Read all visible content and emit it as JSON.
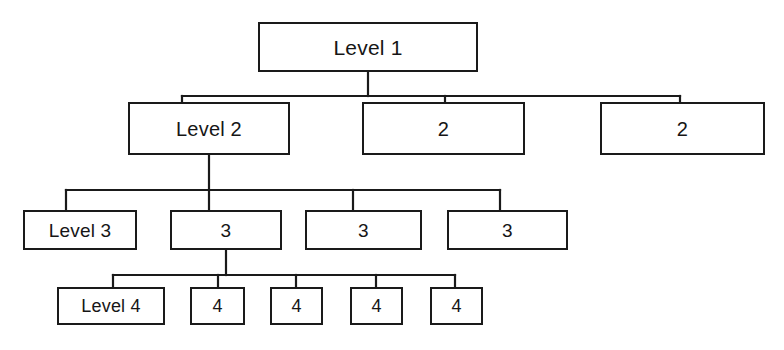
{
  "diagram": {
    "type": "tree-hierarchy",
    "background_color": "#ffffff",
    "line_color": "#1a1a1a",
    "text_color": "#161616",
    "levels": [
      {
        "level": 1,
        "nodes": [
          {
            "id": "n1",
            "label": "Level 1",
            "x": 258,
            "y": 22,
            "w": 220,
            "h": 50
          }
        ]
      },
      {
        "level": 2,
        "nodes": [
          {
            "id": "n2a",
            "label": "Level 2",
            "x": 128,
            "y": 102,
            "w": 162,
            "h": 53
          },
          {
            "id": "n2b",
            "label": "2",
            "x": 362,
            "y": 102,
            "w": 163,
            "h": 53
          },
          {
            "id": "n2c",
            "label": "2",
            "x": 600,
            "y": 102,
            "w": 165,
            "h": 53
          }
        ]
      },
      {
        "level": 3,
        "nodes": [
          {
            "id": "n3a",
            "label": "Level 3",
            "x": 23,
            "y": 210,
            "w": 114,
            "h": 40
          },
          {
            "id": "n3b",
            "label": "3",
            "x": 170,
            "y": 210,
            "w": 112,
            "h": 40
          },
          {
            "id": "n3c",
            "label": "3",
            "x": 305,
            "y": 210,
            "w": 117,
            "h": 40
          },
          {
            "id": "n3d",
            "label": "3",
            "x": 447,
            "y": 210,
            "w": 121,
            "h": 40
          }
        ]
      },
      {
        "level": 4,
        "nodes": [
          {
            "id": "n4a",
            "label": "Level 4",
            "x": 57,
            "y": 287,
            "w": 108,
            "h": 38
          },
          {
            "id": "n4b",
            "label": "4",
            "x": 190,
            "y": 287,
            "w": 55,
            "h": 38
          },
          {
            "id": "n4c",
            "label": "4",
            "x": 270,
            "y": 287,
            "w": 53,
            "h": 38
          },
          {
            "id": "n4d",
            "label": "4",
            "x": 350,
            "y": 287,
            "w": 53,
            "h": 38
          },
          {
            "id": "n4e",
            "label": "4",
            "x": 430,
            "y": 287,
            "w": 53,
            "h": 38
          }
        ]
      }
    ],
    "connectors": {
      "level1_to_level2": {
        "parent_stem": {
          "x": 368,
          "y1": 72,
          "y2": 96
        },
        "bus": {
          "y": 96,
          "x1": 182,
          "x2": 680
        },
        "child_stems": [
          {
            "x": 182,
            "y1": 96,
            "y2": 102
          },
          {
            "x": 445,
            "y1": 96,
            "y2": 102
          },
          {
            "x": 680,
            "y1": 96,
            "y2": 102
          }
        ]
      },
      "level2_to_level3": {
        "parent_stem": {
          "x": 209,
          "y1": 155,
          "y2": 190
        },
        "bus": {
          "y": 190,
          "x1": 66,
          "x2": 500
        },
        "child_stems": [
          {
            "x": 66,
            "y1": 190,
            "y2": 210
          },
          {
            "x": 209,
            "y1": 190,
            "y2": 210
          },
          {
            "x": 353,
            "y1": 190,
            "y2": 210
          },
          {
            "x": 500,
            "y1": 190,
            "y2": 210
          }
        ]
      },
      "level3_to_level4": {
        "parent_stem": {
          "x": 226,
          "y1": 250,
          "y2": 275
        },
        "bus": {
          "y": 275,
          "x1": 113,
          "x2": 455
        },
        "child_stems": [
          {
            "x": 113,
            "y1": 275,
            "y2": 287
          },
          {
            "x": 218,
            "y1": 275,
            "y2": 287
          },
          {
            "x": 296,
            "y1": 275,
            "y2": 287
          },
          {
            "x": 376,
            "y1": 275,
            "y2": 287
          },
          {
            "x": 455,
            "y1": 275,
            "y2": 287
          }
        ]
      }
    }
  }
}
